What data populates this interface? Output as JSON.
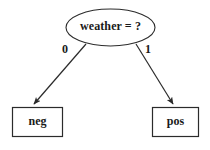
{
  "diagram": {
    "type": "decision-tree",
    "background_color": "#ffffff",
    "stroke_color": "#2b2b2b",
    "text_color": "#1a1a1a",
    "root": {
      "shape": "ellipse",
      "label": "weather = ?"
    },
    "edges": [
      {
        "label": "0",
        "from": "root",
        "to": "leaf-left"
      },
      {
        "label": "1",
        "from": "root",
        "to": "leaf-right"
      }
    ],
    "leaves": [
      {
        "id": "leaf-left",
        "shape": "rectangle",
        "label": "neg"
      },
      {
        "id": "leaf-right",
        "shape": "rectangle",
        "label": "pos"
      }
    ]
  }
}
